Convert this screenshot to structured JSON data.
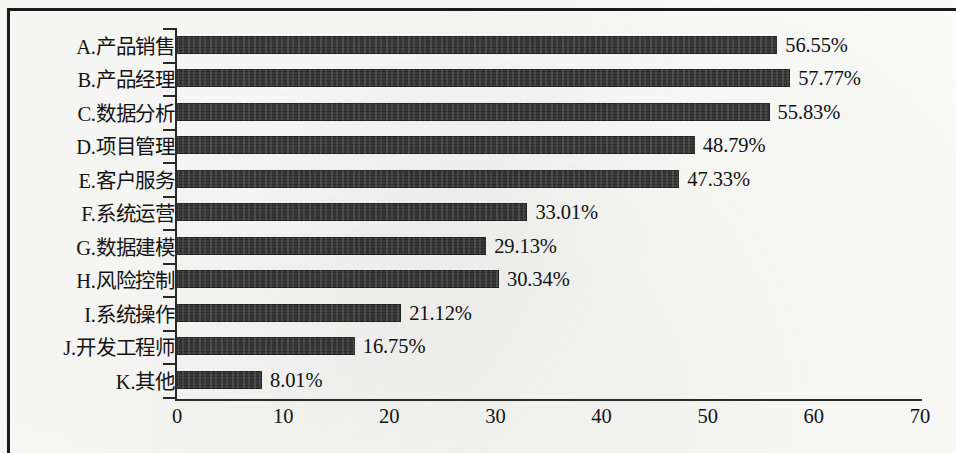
{
  "chart_data": {
    "type": "bar",
    "orientation": "horizontal",
    "title": "",
    "xlabel": "",
    "ylabel": "",
    "xlim": [
      0,
      70
    ],
    "xticks": [
      "0",
      "10",
      "20",
      "30",
      "40",
      "50",
      "60",
      "70"
    ],
    "grid": false,
    "legend": "none",
    "value_suffix": "%",
    "categories": [
      "A.产品销售",
      "B.产品经理",
      "C.数据分析",
      "D.项目管理",
      "E.客户服务",
      "F.系统运营",
      "G.数据建模",
      "H.风险控制",
      "I.系统操作",
      "J.开发工程师",
      "K.其他"
    ],
    "values": [
      56.55,
      57.77,
      55.83,
      48.79,
      47.33,
      33.01,
      29.13,
      30.34,
      21.12,
      16.75,
      8.01
    ],
    "value_labels": [
      "56.55%",
      "57.77%",
      "55.83%",
      "48.79%",
      "47.33%",
      "33.01%",
      "29.13%",
      "30.34%",
      "21.12%",
      "16.75%",
      "8.01%"
    ],
    "bar_color": "#3a3a3a",
    "background_color": "#fbfbf9",
    "axis_color": "#2a2a2a",
    "border_color": "#1b1b1b"
  }
}
